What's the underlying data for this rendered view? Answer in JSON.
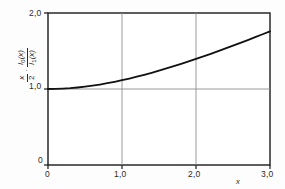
{
  "chart_data": {
    "type": "line",
    "title": "",
    "subtitle": "",
    "xlabel": "x",
    "ylabel": "x/2 · I0(x)/I1(x)",
    "ylabel_parts": {
      "frac1_num": "x",
      "frac1_den": "2",
      "separator": "·",
      "frac2_num": "I0(x)",
      "frac2_den": "I1(x)"
    },
    "xlim": [
      0,
      3
    ],
    "ylim": [
      0,
      2
    ],
    "xticks": [
      0,
      1,
      2,
      3
    ],
    "xticklabels": [
      "0",
      "1,0",
      "2,0",
      "3,0"
    ],
    "yticks": [
      0,
      1,
      2
    ],
    "yticklabels": [
      "0",
      "1,0",
      "2,0"
    ],
    "grid": true,
    "grid_lines_x": [
      1,
      2
    ],
    "grid_lines_y": [
      1
    ],
    "legend": null,
    "series": [
      {
        "name": "x/2 * I0(x)/I1(x)",
        "x": [
          0.0,
          0.1,
          0.2,
          0.3,
          0.4,
          0.5,
          0.6,
          0.7,
          0.8,
          0.9,
          1.0,
          1.1,
          1.2,
          1.3,
          1.4,
          1.5,
          1.6,
          1.7,
          1.8,
          1.9,
          2.0,
          2.1,
          2.2,
          2.3,
          2.4,
          2.5,
          2.6,
          2.7,
          2.8,
          2.9,
          3.0
        ],
        "y": [
          1.0,
          1.001,
          1.005,
          1.011,
          1.02,
          1.031,
          1.044,
          1.059,
          1.076,
          1.095,
          1.116,
          1.138,
          1.162,
          1.187,
          1.213,
          1.241,
          1.27,
          1.3,
          1.331,
          1.363,
          1.396,
          1.429,
          1.463,
          1.498,
          1.534,
          1.57,
          1.607,
          1.644,
          1.682,
          1.72,
          1.759
        ],
        "color": "#111111",
        "width": 1.8
      }
    ],
    "colors": {
      "axis": "#1a1a1a",
      "grid": "#8c8c8c",
      "curve": "#111111",
      "background": "#fdfdfd",
      "text": "#2b2b2b"
    }
  },
  "axis": {
    "x_name": "x",
    "y_name_frac1_num": "x",
    "y_name_frac1_den": "2",
    "y_name_sep": "·",
    "y_name_frac2_num_base": "I",
    "y_name_frac2_num_sub": "0",
    "y_name_frac2_num_arg": "(x)",
    "y_name_frac2_den_base": "I",
    "y_name_frac2_den_sub": "1",
    "y_name_frac2_den_arg": "(x)"
  },
  "ticks": {
    "y_top": "2,0",
    "y_mid": "1,0",
    "y_bottom": "0",
    "x_0": "0",
    "x_1": "1,0",
    "x_2": "2,0",
    "x_3": "3,0"
  }
}
